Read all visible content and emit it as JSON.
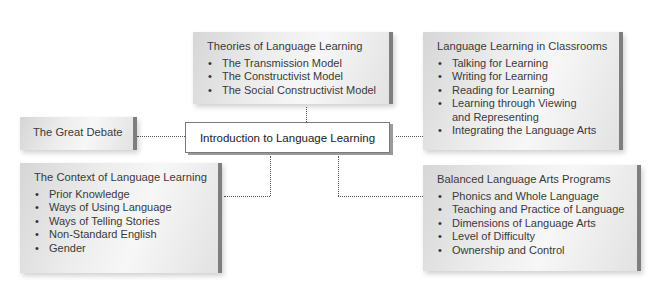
{
  "diagram": {
    "center": {
      "label": "Introduction to Language Learning"
    },
    "nodes": {
      "theories": {
        "title": "Theories of Language Learning",
        "items": [
          "The Transmission Model",
          "The Constructivist Model",
          "The Social Constructivist Model"
        ]
      },
      "classrooms": {
        "title": "Language Learning in Classrooms",
        "items": [
          "Talking for Learning",
          "Writing for Learning",
          "Reading for Learning",
          "Learning through Viewing",
          "and Representing",
          "Integrating the Language Arts"
        ]
      },
      "great_debate": {
        "title": "The Great Debate"
      },
      "context": {
        "title": "The Context of Language Learning",
        "items": [
          "Prior Knowledge",
          "Ways of Using Language",
          "Ways of Telling Stories",
          "Non-Standard English",
          "Gender"
        ]
      },
      "balanced": {
        "title": "Balanced Language Arts Programs",
        "items": [
          "Phonics and Whole Language",
          "Teaching and Practice of Language",
          "Dimensions of Language Arts",
          "Level of Difficulty",
          "Ownership and Control"
        ]
      }
    },
    "colors": {
      "box_edge": "#7e7e7e",
      "box_fill": "#ececec",
      "connector": "#555555"
    }
  }
}
